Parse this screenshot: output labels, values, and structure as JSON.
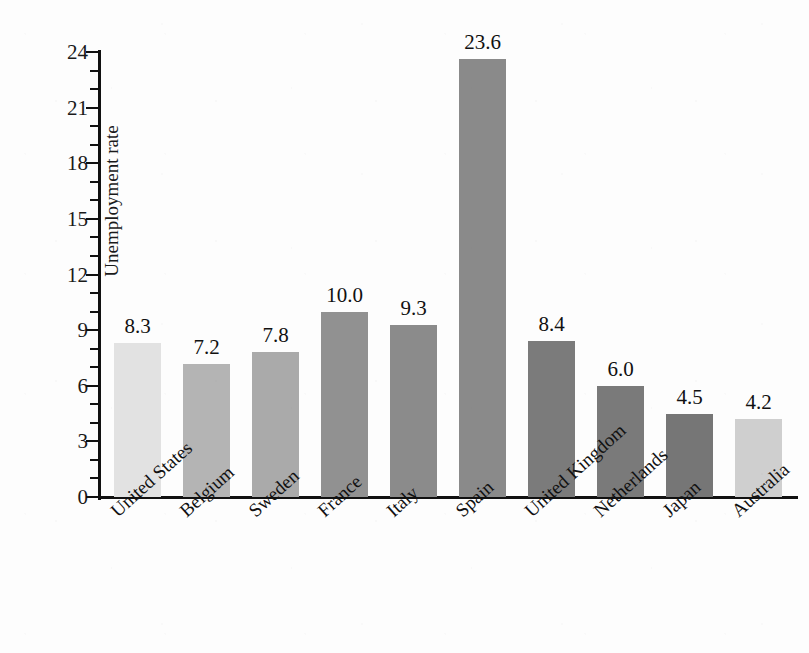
{
  "chart_data": {
    "type": "bar",
    "title": "",
    "xlabel": "",
    "ylabel": "Unemployment rate",
    "categories": [
      "United States",
      "Belgium",
      "Sweden",
      "France",
      "Italy",
      "Spain",
      "United Kingdom",
      "Netherlands",
      "Japan",
      "Australia"
    ],
    "values": [
      8.3,
      7.2,
      7.8,
      10.0,
      9.3,
      23.6,
      8.4,
      6.0,
      4.5,
      4.2
    ],
    "value_labels": [
      "8.3",
      "7.2",
      "7.8",
      "10.0",
      "9.3",
      "23.6",
      "8.4",
      "6.0",
      "4.5",
      "4.2"
    ],
    "bar_colors": [
      "#e2e2e2",
      "#b4b4b4",
      "#aaaaaa",
      "#919191",
      "#8b8b8b",
      "#8a8a8a",
      "#7b7b7b",
      "#7a7a7a",
      "#767676",
      "#cfcfcf"
    ],
    "ylim": [
      0,
      24
    ],
    "ytick_labels": [
      "0",
      "3",
      "6",
      "9",
      "12",
      "15",
      "18",
      "21",
      "24"
    ],
    "ytick_values": [
      0,
      3,
      6,
      9,
      12,
      15,
      18,
      21,
      24
    ],
    "minor_tick_interval": 1,
    "grid": false,
    "legend": "none",
    "xlabel_rotation_deg": -42
  }
}
